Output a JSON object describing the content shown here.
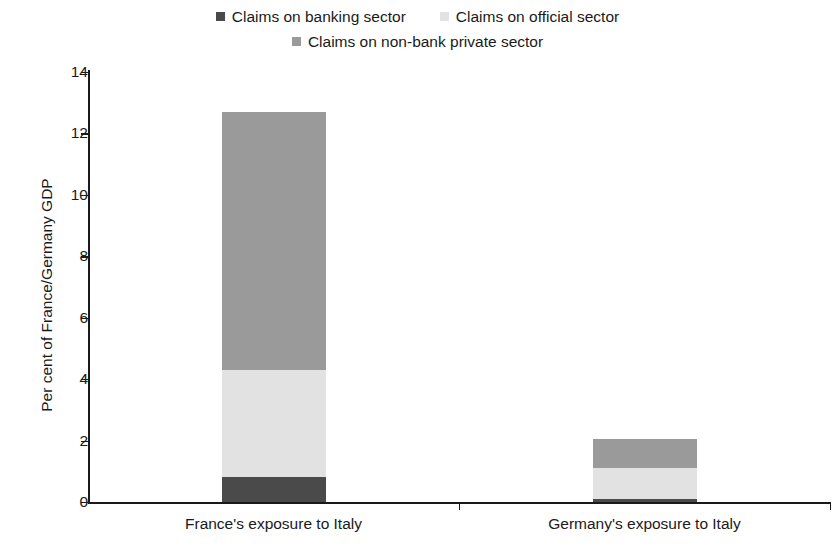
{
  "legend": {
    "position": "top",
    "rows": [
      [
        {
          "label": "Claims on banking sector",
          "color": "#4a4a4a",
          "icon": "legend-square-icon"
        },
        {
          "label": "Claims on official sector",
          "color": "#e2e2e2",
          "icon": "legend-square-icon"
        }
      ],
      [
        {
          "label": "Claims on non-bank private sector",
          "color": "#9a9a9a",
          "icon": "legend-square-icon"
        }
      ]
    ]
  },
  "axes": {
    "y_title": "Per cent of France/Germany GDP",
    "y_ticks": [
      "0",
      "2",
      "4",
      "6",
      "8",
      "10",
      "12",
      "14"
    ],
    "x_labels": [
      "France's exposure to Italy",
      "Germany's exposure to Italy"
    ]
  },
  "chart_data": {
    "type": "bar",
    "stacked": true,
    "title": "",
    "xlabel": "",
    "ylabel": "Per cent of France/Germany GDP",
    "ylim": [
      0,
      14
    ],
    "ytick_step": 2,
    "grid": false,
    "legend_position": "top",
    "categories": [
      "France's exposure to Italy",
      "Germany's exposure to Italy"
    ],
    "series": [
      {
        "name": "Claims on banking sector",
        "color": "#4a4a4a",
        "values": [
          0.8,
          0.1
        ]
      },
      {
        "name": "Claims on official sector",
        "color": "#e2e2e2",
        "values": [
          3.5,
          1.0
        ]
      },
      {
        "name": "Claims on non-bank private sector",
        "color": "#9a9a9a",
        "values": [
          8.4,
          0.95
        ]
      }
    ],
    "totals": [
      12.7,
      2.05
    ]
  }
}
